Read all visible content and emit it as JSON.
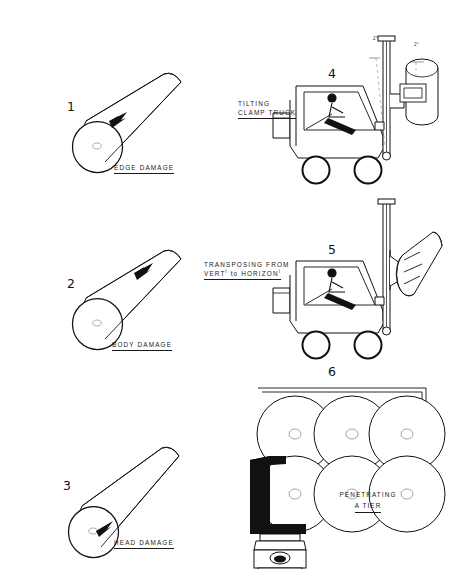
{
  "figure": {
    "type": "technical-line-drawing",
    "background": "#ffffff",
    "ink": "#111111",
    "width": 449,
    "height": 569
  },
  "panels": [
    {
      "number": "1",
      "subject": "paper-roll",
      "caption": "EDGE DAMAGE",
      "caption_underlined": true,
      "damage_marker": "edge",
      "icon": "roll-cylinder-icon"
    },
    {
      "number": "2",
      "subject": "paper-roll",
      "caption": "BODY DAMAGE",
      "caption_underlined": true,
      "damage_marker": "body",
      "icon": "roll-cylinder-icon"
    },
    {
      "number": "3",
      "subject": "paper-roll",
      "caption": "HEAD DAMAGE",
      "caption_underlined": true,
      "damage_marker": "head",
      "icon": "roll-cylinder-icon"
    },
    {
      "number": "4",
      "subject": "clamp-truck-side-view",
      "caption_line1": "TILTING",
      "caption_line2": "CLAMP TRUCK",
      "caption_underlined": true,
      "icon": "forklift-icon",
      "angle_left": "2°",
      "angle_right": "2°",
      "load_orientation": "vertical"
    },
    {
      "number": "5",
      "subject": "clamp-truck-side-view",
      "caption_line1": "TRANSPOSING FROM",
      "caption_line2_a": "VERT",
      "caption_line2_sup1": "l",
      "caption_line2_b": " to HORIZON",
      "caption_line2_sup2": "l",
      "caption_underlined": true,
      "icon": "forklift-icon",
      "load_orientation": "tilted"
    },
    {
      "number": "6",
      "subject": "roll-tier-end-view",
      "caption_line1": "PENETRATING",
      "caption_line2": "A TIER",
      "caption_underlined": true,
      "icon": "truck-front-icon",
      "tier_rows": 2,
      "tier_cols": 3,
      "rolls_total": 6
    }
  ]
}
